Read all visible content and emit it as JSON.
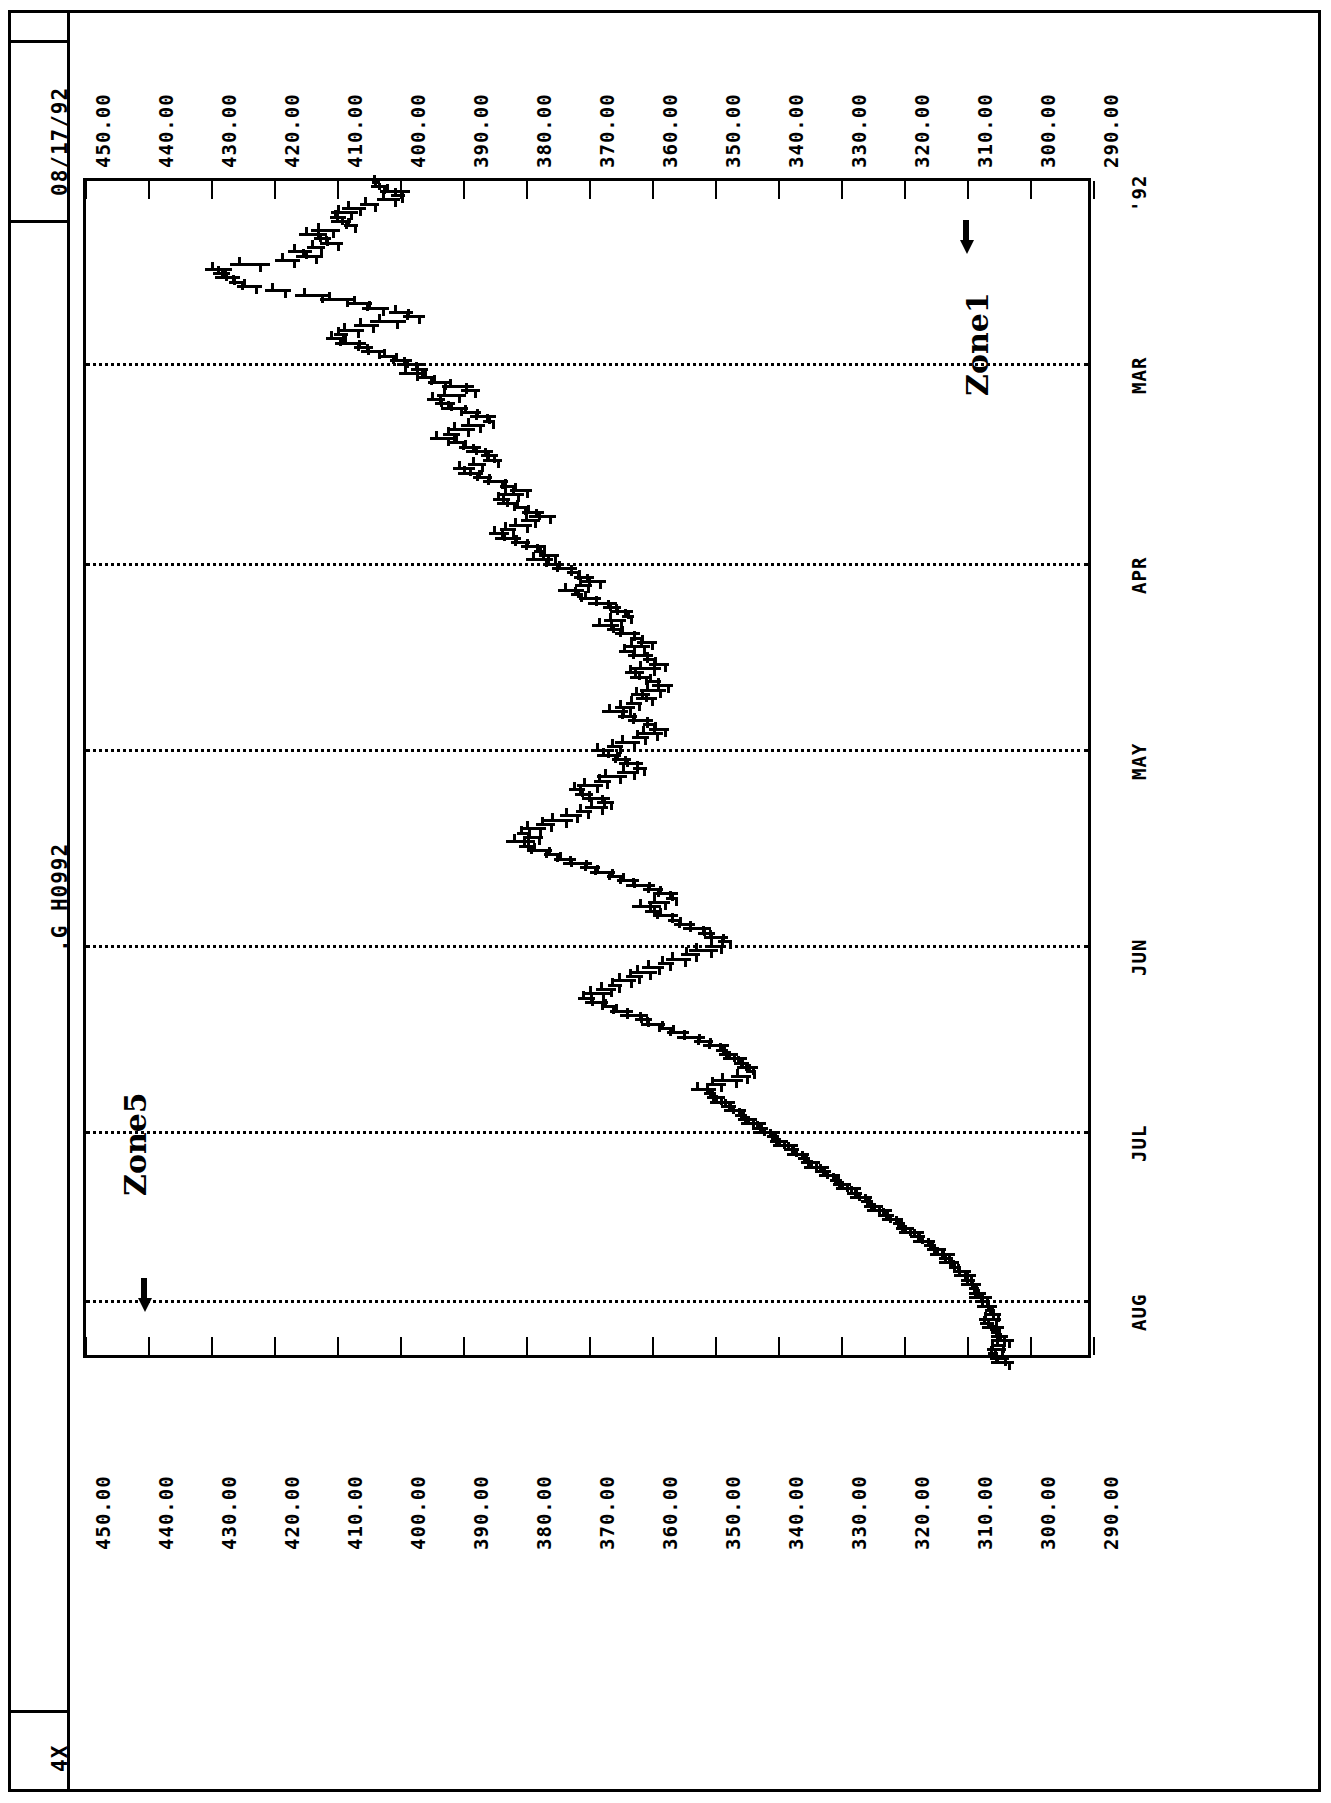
{
  "header": {
    "date": "08/17/92",
    "symbol": ".G H0992",
    "scale": "4X"
  },
  "annotations": [
    {
      "label": "Zone5",
      "x": 118,
      "y": 1196
    },
    {
      "label": "Zone1",
      "x": 960,
      "y": 396
    }
  ],
  "arrows": [
    {
      "name": "zone5-arrow",
      "x": 128,
      "y": 1288
    },
    {
      "name": "zone1-arrow",
      "x": 950,
      "y": 230
    }
  ],
  "chart_data": {
    "type": "bar",
    "title": ".G H0992",
    "subtitle": "08/17/92",
    "orientation": "rotated-90",
    "xlabel": "",
    "ylabel": "",
    "grid": true,
    "legend_position": "none",
    "ylim": [
      290.0,
      450.0
    ],
    "ytick_labels": [
      "450.00",
      "440.00",
      "430.00",
      "420.00",
      "410.00",
      "400.00",
      "390.00",
      "380.00",
      "370.00",
      "360.00",
      "350.00",
      "340.00",
      "330.00",
      "320.00",
      "310.00",
      "300.00",
      "290.00"
    ],
    "ytick_values": [
      450,
      440,
      430,
      420,
      410,
      400,
      390,
      380,
      370,
      360,
      350,
      340,
      330,
      320,
      310,
      300,
      290
    ],
    "xtick_labels": [
      "'92",
      "MAR",
      "APR",
      "MAY",
      "JUN",
      "JUL",
      "AUG"
    ],
    "series": [
      {
        "name": "price",
        "style": "ohlc-bar",
        "values": [
          404.0,
          403.5,
          401.0,
          400.5,
          402.0,
          405.0,
          407.5,
          409.0,
          410.0,
          409.5,
          408.0,
          412.0,
          414.0,
          412.5,
          411.0,
          413.5,
          416.0,
          414.5,
          418.0,
          424.0,
          429.0,
          428.5,
          427.5,
          426.0,
          424.0,
          419.5,
          414.0,
          410.0,
          406.5,
          404.0,
          400.0,
          398.0,
          402.0,
          405.5,
          408.0,
          409.5,
          410.5,
          408.0,
          406.0,
          404.5,
          402.0,
          400.0,
          398.5,
          397.0,
          398.5,
          396.0,
          394.0,
          391.0,
          389.0,
          392.0,
          394.5,
          393.0,
          391.5,
          389.0,
          387.0,
          386.0,
          388.5,
          390.5,
          392.0,
          393.5,
          391.0,
          389.0,
          387.5,
          386.0,
          385.5,
          388.0,
          390.0,
          389.0,
          387.0,
          385.0,
          383.0,
          381.0,
          382.5,
          384.0,
          383.0,
          381.0,
          379.0,
          377.5,
          379.5,
          381.0,
          383.0,
          384.5,
          383.0,
          381.0,
          379.0,
          378.0,
          376.5,
          378.0,
          376.0,
          374.0,
          372.5,
          371.0,
          369.5,
          371.0,
          373.0,
          372.0,
          370.0,
          368.0,
          366.5,
          365.0,
          364.0,
          366.0,
          367.5,
          366.0,
          364.0,
          362.5,
          361.0,
          362.5,
          364.0,
          362.0,
          360.5,
          359.0,
          361.0,
          363.0,
          362.0,
          360.0,
          358.5,
          360.0,
          362.0,
          361.0,
          363.0,
          364.5,
          366.0,
          364.0,
          362.0,
          360.5,
          359.0,
          360.5,
          362.0,
          364.0,
          366.0,
          368.0,
          367.0,
          365.0,
          363.5,
          362.0,
          364.0,
          366.5,
          368.0,
          370.0,
          372.0,
          371.0,
          369.0,
          367.5,
          369.0,
          371.0,
          373.0,
          375.0,
          377.0,
          379.0,
          380.5,
          379.0,
          381.0,
          380.0,
          378.0,
          376.0,
          374.0,
          372.0,
          370.0,
          368.0,
          366.0,
          364.0,
          362.0,
          360.0,
          358.0,
          357.0,
          359.0,
          361.0,
          360.0,
          358.0,
          356.5,
          355.0,
          353.0,
          351.5,
          350.0,
          348.5,
          350.0,
          352.0,
          354.0,
          356.0,
          358.0,
          360.0,
          361.5,
          363.0,
          364.5,
          366.0,
          367.5,
          369.0,
          370.5,
          369.0,
          367.0,
          365.0,
          363.0,
          361.5,
          360.0,
          358.0,
          356.0,
          354.0,
          352.0,
          350.0,
          349.0,
          348.0,
          347.0,
          346.0,
          345.0,
          344.5,
          346.0,
          348.0,
          350.0,
          352.0,
          351.0,
          350.0,
          349.0,
          348.0,
          347.0,
          346.0,
          345.0,
          344.0,
          343.0,
          342.0,
          341.0,
          340.0,
          339.0,
          338.0,
          337.0,
          336.0,
          335.0,
          334.0,
          333.0,
          332.0,
          331.0,
          330.0,
          329.0,
          328.0,
          327.0,
          326.0,
          325.0,
          324.0,
          323.0,
          322.0,
          321.0,
          320.0,
          319.0,
          318.0,
          317.0,
          316.0,
          315.0,
          314.0,
          313.5,
          313.0,
          312.0,
          311.0,
          310.5,
          310.0,
          309.5,
          309.0,
          308.5,
          308.0,
          307.5,
          307.0,
          306.5,
          306.0,
          306.5,
          307.0,
          306.0,
          305.5,
          305.0,
          304.5,
          305.0,
          305.5,
          306.0,
          305.0,
          304.5
        ]
      }
    ]
  }
}
